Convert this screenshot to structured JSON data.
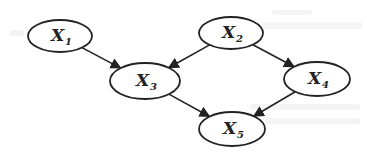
{
  "diagram": {
    "type": "directed-graph",
    "stroke_color": "#222222",
    "background": "#ffffff",
    "nodes": [
      {
        "id": "X1",
        "base": "X",
        "sub": "1",
        "cx": 60,
        "cy": 36,
        "rx": 32,
        "ry": 16
      },
      {
        "id": "X2",
        "base": "X",
        "sub": "2",
        "cx": 231,
        "cy": 33,
        "rx": 32,
        "ry": 16
      },
      {
        "id": "X3",
        "base": "X",
        "sub": "3",
        "cx": 145,
        "cy": 81,
        "rx": 35,
        "ry": 18
      },
      {
        "id": "X4",
        "base": "X",
        "sub": "4",
        "cx": 317,
        "cy": 79,
        "rx": 33,
        "ry": 17
      },
      {
        "id": "X5",
        "base": "X",
        "sub": "5",
        "cx": 232,
        "cy": 129,
        "rx": 33,
        "ry": 17
      }
    ],
    "edges": [
      {
        "from": "X1",
        "to": "X3"
      },
      {
        "from": "X2",
        "to": "X3"
      },
      {
        "from": "X2",
        "to": "X4"
      },
      {
        "from": "X3",
        "to": "X5"
      },
      {
        "from": "X4",
        "to": "X5"
      }
    ]
  }
}
